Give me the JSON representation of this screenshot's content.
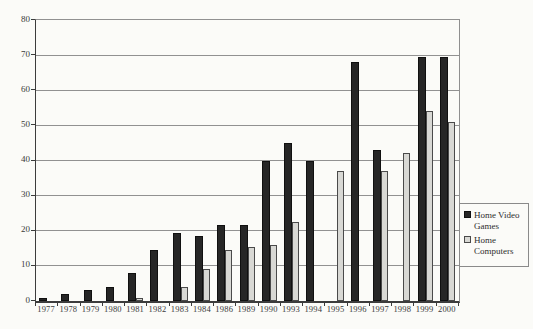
{
  "chart_data": {
    "type": "bar",
    "title": "",
    "xlabel": "",
    "ylabel": "",
    "categories": [
      "1977",
      "1978",
      "1979",
      "1980",
      "1981",
      "1982",
      "1983",
      "1984",
      "1986",
      "1989",
      "1990",
      "1993",
      "1994",
      "1995",
      "1996",
      "1997",
      "1998",
      "1999",
      "2000"
    ],
    "series": [
      {
        "name": "Home Video Games",
        "color": "#262626",
        "values": [
          1,
          2,
          3,
          4,
          8,
          14.5,
          19.5,
          18.5,
          21.5,
          21.5,
          40,
          45,
          40,
          null,
          68,
          43,
          null,
          69.5,
          69.5
        ]
      },
      {
        "name": "Home Computers",
        "color": "#d8d8d4",
        "values": [
          null,
          null,
          null,
          null,
          1,
          null,
          4,
          9,
          14.5,
          15.5,
          16,
          22.5,
          null,
          37,
          null,
          37,
          42,
          54,
          51
        ]
      }
    ],
    "ylim": [
      0,
      80
    ],
    "yticks": [
      0,
      10,
      20,
      30,
      40,
      50,
      60,
      70,
      80
    ],
    "grid": true,
    "legend_position": "right"
  },
  "colors": {
    "background": "#fbfbf8",
    "gridline": "#919191",
    "axis": "#3c3c3c",
    "bar_dark": "#262626",
    "bar_light": "#d8d8d4"
  }
}
